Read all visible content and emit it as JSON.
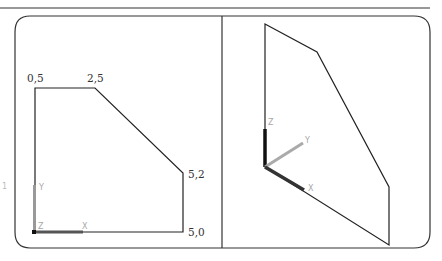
{
  "figure": {
    "panels": [
      {
        "name": "top-view",
        "vertex_labels": [
          {
            "text": "0,5",
            "x": 27,
            "y": 82
          },
          {
            "text": "2,5",
            "x": 87,
            "y": 82
          },
          {
            "text": "5,2",
            "x": 188,
            "y": 178
          },
          {
            "text": "5,0",
            "x": 188,
            "y": 236
          }
        ],
        "axes": {
          "x_label": "X",
          "y_label": "Y",
          "z_label": "Z"
        }
      },
      {
        "name": "isometric-view",
        "axes": {
          "x_label": "X",
          "y_label": "Y",
          "z_label": "Z"
        }
      }
    ],
    "side_mark": "1",
    "colors": {
      "line": "#222222",
      "axis_label": "#a8a8a8",
      "frame": "#333333"
    }
  }
}
